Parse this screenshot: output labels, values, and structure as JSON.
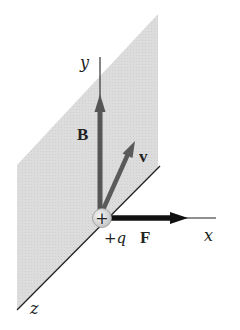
{
  "diagram": {
    "colors": {
      "plane_fill": "#d9d9d9",
      "vector_gray": "#555555",
      "force_black": "#111111",
      "axis_line": "#222222",
      "charge_fill": "#e6e6e6"
    },
    "axes": {
      "x_label": "x",
      "y_label": "y",
      "z_label": "z"
    },
    "vectors": {
      "magnetic_field_label": "B",
      "velocity_label": "v",
      "force_label": "F"
    },
    "charge": {
      "symbol": "+",
      "label": "+q"
    }
  }
}
